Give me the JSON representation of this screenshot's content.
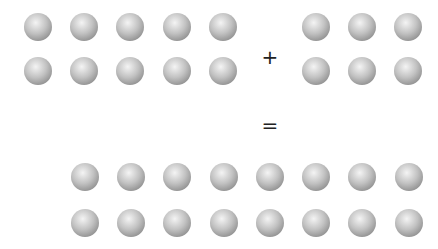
{
  "diagram": {
    "sphere_radius": 14,
    "colors": {
      "sphere_light": "#f4f4f4",
      "sphere_mid": "#c2c2c2",
      "sphere_dark": "#8e8e8e",
      "operator": "#222222"
    },
    "groups": [
      {
        "name": "left-addend",
        "count": 10,
        "cols": [
          38,
          84,
          130,
          177,
          223
        ],
        "rows": [
          27,
          71
        ]
      },
      {
        "name": "right-addend",
        "count": 6,
        "cols": [
          316,
          362,
          408
        ],
        "rows": [
          27,
          71
        ]
      },
      {
        "name": "sum",
        "count": 16,
        "cols": [
          85,
          131,
          177,
          224,
          270,
          316,
          362,
          409
        ],
        "rows": [
          177,
          223
        ]
      }
    ],
    "operators": [
      {
        "name": "plus-sign",
        "symbol": "+",
        "x": 270,
        "y": 64
      },
      {
        "name": "equals-sign",
        "symbol": "=",
        "x": 270,
        "y": 132
      }
    ]
  }
}
